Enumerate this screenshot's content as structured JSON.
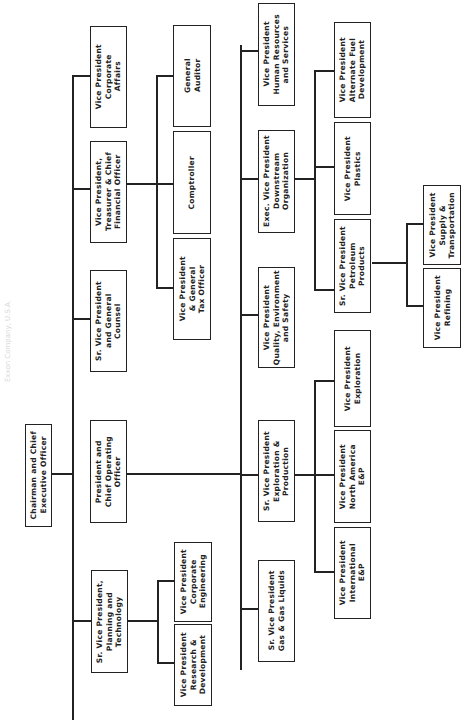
{
  "caption": "Exxon Company, U.S.A.",
  "nodes": {
    "ceo": "Chairman and Chief\nExecutive Officer",
    "president": "President and\nChief Operating\nOfficer",
    "svp_planning": "Sr. Vice President,\nPlanning and\nTechnology",
    "vp_research": "Vice President\nResearch &\nDevelopment",
    "vp_engineering": "Vice President\nCorporate\nEngineering",
    "svp_counsel": "Sr. Vice President\nand General\nCounsel",
    "vp_cfo": "Vice President,\nTreasurer & Chief\nFinancial Officer",
    "vp_tax": "Vice President\n& General\nTax Officer",
    "comptroller": "Comptroller",
    "auditor": "General\nAuditor",
    "vp_corporate_affairs": "Vice President\nCorporate\nAffairs",
    "svp_gas": "Sr. Vice President\nGas & Gas Liquids",
    "svp_exploration_production": "Sr. Vice President\nExploration &\nProduction",
    "vp_international": "Vice President\nInternational\nE&P",
    "vp_north_america": "Vice President\nNorth America\nE&P",
    "vp_exploration": "Vice President\nExploration",
    "vp_quality": "Vice President\nQuality, Environment\nand Safety",
    "evp_downstream": "Exec. Vice President\nDownstream\nOrganization",
    "svp_petroleum": "Sr. Vice President\nPetroleum\nProducts",
    "vp_plastics": "Vice President\nPlastics",
    "vp_alt_fuel": "Vice President\nAlternate Fuel\nDevelopment",
    "vp_refining": "Vice President\nRefining",
    "vp_supply": "Vice President\nSupply &\nTransportation",
    "vp_human_resources": "Vice President\nHuman Resources\nand Services"
  }
}
